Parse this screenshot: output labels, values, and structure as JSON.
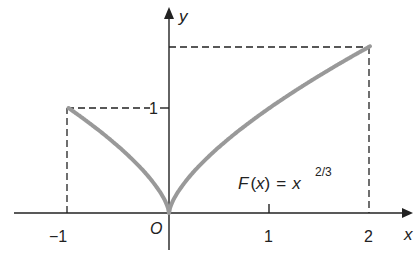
{
  "chart_data": {
    "type": "line",
    "title": "",
    "function_label": "F(x) = x^(2/3)",
    "function_label_parts": {
      "lhs": "F",
      "arg": "x",
      "eq": "=",
      "base": "x",
      "exponent": "2/3"
    },
    "xlabel": "x",
    "ylabel": "y",
    "origin_label": "O",
    "x_ticks": [
      {
        "value": -1,
        "label": "−1"
      },
      {
        "value": 1,
        "label": "1"
      },
      {
        "value": 2,
        "label": "2"
      }
    ],
    "y_ticks": [
      {
        "value": 1,
        "label": "1"
      }
    ],
    "xlim": [
      -1.5,
      2.4
    ],
    "ylim": [
      -0.4,
      2.0
    ],
    "series": [
      {
        "name": "F(x) = x^(2/3)",
        "domain": [
          -1,
          2
        ],
        "x": [
          -1,
          -0.75,
          -0.5,
          -0.25,
          0,
          0.25,
          0.5,
          0.75,
          1,
          1.25,
          1.5,
          1.75,
          2
        ],
        "y": [
          1,
          0.825,
          0.63,
          0.397,
          0,
          0.397,
          0.63,
          0.825,
          1,
          1.16,
          1.31,
          1.452,
          1.587
        ],
        "color": "#999999"
      }
    ],
    "dashed_guides": [
      {
        "from": [
          -1,
          0
        ],
        "to": [
          -1,
          1
        ]
      },
      {
        "from": [
          -1,
          1
        ],
        "to": [
          0,
          1
        ]
      },
      {
        "from": [
          0,
          1.587
        ],
        "to": [
          2,
          1.587
        ]
      },
      {
        "from": [
          2,
          0
        ],
        "to": [
          2,
          1.587
        ]
      }
    ],
    "grid": false,
    "legend": "none"
  },
  "labels": {
    "y_axis": "y",
    "x_axis": "x",
    "origin": "O",
    "tick_neg1": "−1",
    "tick_1x": "1",
    "tick_2x": "2",
    "tick_1y": "1",
    "func_F": "F",
    "func_open": "(",
    "func_x": "x",
    "func_close": ")",
    "func_eq": "=",
    "func_base": "x",
    "func_exp": "2/3"
  },
  "colors": {
    "axis": "#222222",
    "curve": "#999999",
    "dash": "#222222"
  }
}
